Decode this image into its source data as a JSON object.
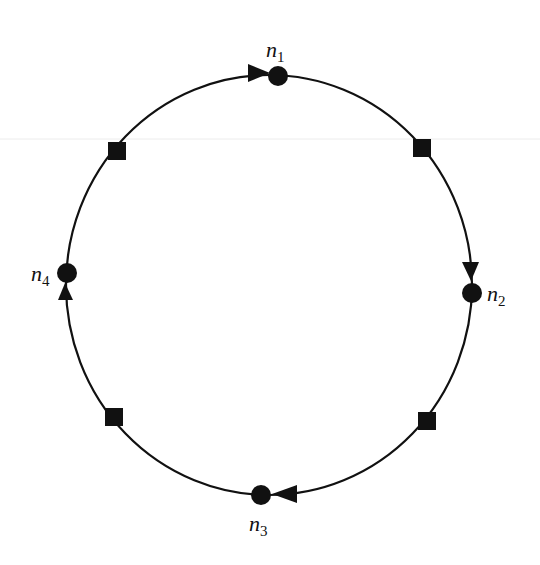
{
  "diagram": {
    "type": "cycle",
    "colors": {
      "stroke": "#111111",
      "background": "#ffffff",
      "bleed": "#e6e6e6"
    },
    "ring": {
      "cx": 269,
      "cy": 285,
      "rx": 203,
      "ry": 210
    },
    "nodes": [
      {
        "id": "n1",
        "base": "n",
        "sub": "1",
        "x": 278,
        "y": 76,
        "label_x": 266,
        "label_y": 57
      },
      {
        "id": "n2",
        "base": "n",
        "sub": "2",
        "x": 472,
        "y": 293,
        "label_x": 487,
        "label_y": 301
      },
      {
        "id": "n3",
        "base": "n",
        "sub": "3",
        "x": 261,
        "y": 495,
        "label_x": 249,
        "label_y": 531
      },
      {
        "id": "n4",
        "base": "n",
        "sub": "4",
        "x": 67,
        "y": 273,
        "label_x": 31,
        "label_y": 281
      }
    ],
    "squares": [
      {
        "id": "s-upper-left",
        "x": 117,
        "y": 151
      },
      {
        "id": "s-upper-right",
        "x": 422,
        "y": 148
      },
      {
        "id": "s-lower-right",
        "x": 427,
        "y": 421
      },
      {
        "id": "s-lower-left",
        "x": 114,
        "y": 417
      }
    ],
    "arrows": [
      {
        "id": "arrow-into-n1",
        "points": "248,64 270,73 248,82",
        "direction": "right"
      },
      {
        "id": "arrow-into-n2",
        "points": "462,262 479,262 471,281",
        "direction": "down"
      },
      {
        "id": "arrow-into-n3",
        "points": "297,485 272,494 297,503",
        "direction": "left"
      },
      {
        "id": "arrow-into-n4",
        "points": "58,300 73,300 65,283",
        "direction": "up"
      }
    ],
    "edges": [
      {
        "from": "n4",
        "to": "n1"
      },
      {
        "from": "n1",
        "to": "n2"
      },
      {
        "from": "n2",
        "to": "n3"
      },
      {
        "from": "n3",
        "to": "n4"
      }
    ]
  }
}
